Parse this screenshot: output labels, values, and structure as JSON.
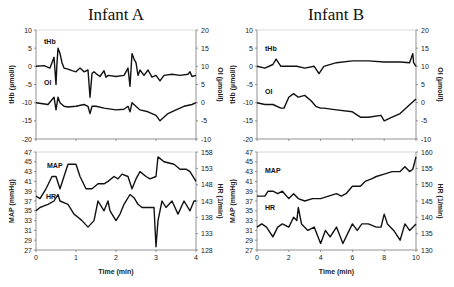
{
  "chart_data": [
    {
      "type": "line",
      "panel": "Infant A - top",
      "title": "Infant A",
      "xlabel": "",
      "ylabel": "tHb (µmol/l)",
      "y2label": "OI (µmol/l)",
      "xlim": [
        0,
        4
      ],
      "ylim": [
        -20,
        10
      ],
      "y2lim": [
        -10,
        20
      ],
      "yticks": [
        10,
        5,
        0,
        -5,
        -10,
        -15,
        -20
      ],
      "y2ticks": [
        20,
        15,
        10,
        5,
        0,
        -5,
        -10
      ],
      "grid": false,
      "series": [
        {
          "name": "tHb",
          "axis": "left",
          "x": [
            0,
            0.2,
            0.35,
            0.45,
            0.5,
            0.52,
            0.55,
            0.6,
            0.65,
            0.7,
            0.8,
            0.9,
            1.0,
            1.1,
            1.2,
            1.3,
            1.35,
            1.4,
            1.45,
            1.5,
            1.6,
            1.7,
            1.75,
            1.8,
            2.0,
            2.2,
            2.3,
            2.35,
            2.4,
            2.45,
            2.5,
            2.55,
            2.6,
            2.7,
            2.8,
            2.9,
            3.0,
            3.1,
            3.2,
            3.4,
            3.6,
            3.8,
            3.85,
            3.9,
            4.0
          ],
          "values": [
            0,
            0.2,
            -0.5,
            2.5,
            -5,
            0,
            5,
            3.5,
            1,
            -0.5,
            -0.8,
            -1.2,
            -1.5,
            -0.5,
            -1.5,
            -1,
            -8.5,
            -2,
            -1.5,
            -2,
            -2.8,
            -1.2,
            -3,
            -2.5,
            -2.8,
            -2.5,
            -0.5,
            -5.5,
            3.5,
            2,
            1,
            -2.5,
            -1,
            -2.5,
            -1,
            -3,
            -2.5,
            -4,
            -2.5,
            -2.2,
            -2.5,
            -2.2,
            -1.5,
            -2.8,
            -2.5
          ]
        },
        {
          "name": "OI",
          "axis": "right",
          "x": [
            0,
            0.3,
            0.45,
            0.5,
            0.55,
            0.6,
            0.7,
            0.8,
            1.0,
            1.2,
            1.3,
            1.35,
            1.4,
            1.5,
            1.7,
            2.0,
            2.2,
            2.3,
            2.35,
            2.4,
            2.6,
            2.8,
            3.0,
            3.1,
            3.3,
            3.5,
            3.7,
            3.9,
            4.0
          ],
          "values": [
            0,
            -0.5,
            1.5,
            -2,
            1.5,
            0,
            -1,
            -1.2,
            -1,
            -0.5,
            -1,
            -3,
            -1,
            -1,
            -1.5,
            -2,
            -1.8,
            -1,
            -2.5,
            0,
            -2,
            -2.5,
            -3.5,
            -5,
            -3,
            -2,
            -1,
            -0.5,
            0
          ]
        }
      ]
    },
    {
      "type": "line",
      "panel": "Infant A - bottom",
      "xlabel": "Time (min)",
      "ylabel": "MAP (mmHg)",
      "y2label": "HR (1/min)",
      "xlim": [
        0,
        4
      ],
      "xticks": [
        0,
        1,
        2,
        3,
        4
      ],
      "ylim": [
        27,
        47
      ],
      "y2lim": [
        128,
        158
      ],
      "yticks": [
        47,
        45,
        43,
        41,
        39,
        37,
        35,
        33,
        31,
        29,
        27
      ],
      "y2ticks": [
        158,
        153,
        148,
        143,
        138,
        133,
        128
      ],
      "grid": false,
      "series": [
        {
          "name": "MAP",
          "axis": "left",
          "x": [
            0,
            0.1,
            0.25,
            0.4,
            0.5,
            0.6,
            0.7,
            0.8,
            1.0,
            1.1,
            1.25,
            1.4,
            1.55,
            1.7,
            1.8,
            1.95,
            2.05,
            2.15,
            2.3,
            2.4,
            2.5,
            2.6,
            2.75,
            2.85,
            3.0,
            3.05,
            3.2,
            3.45,
            3.6,
            3.75,
            3.85,
            4.0
          ],
          "values": [
            38,
            37.5,
            39.5,
            42,
            42,
            39.5,
            42,
            44.5,
            44.5,
            42,
            39.5,
            39.5,
            40.5,
            40.5,
            41,
            42,
            41.5,
            42.5,
            42,
            39.5,
            41.5,
            43,
            42,
            41.5,
            42,
            46,
            45,
            44.5,
            43.5,
            43.5,
            43,
            41
          ]
        },
        {
          "name": "HR",
          "axis": "right",
          "x": [
            0,
            0.1,
            0.2,
            0.3,
            0.45,
            0.55,
            0.6,
            0.8,
            0.95,
            1.05,
            1.15,
            1.3,
            1.45,
            1.55,
            1.7,
            1.8,
            1.85,
            2.0,
            2.1,
            2.2,
            2.35,
            2.45,
            2.55,
            2.65,
            2.8,
            2.95,
            3.0,
            3.05,
            3.15,
            3.25,
            3.4,
            3.55,
            3.7,
            3.85,
            3.95,
            4.0
          ],
          "values": [
            140,
            141,
            141.5,
            142,
            143,
            145,
            143,
            142,
            139,
            138,
            137,
            135,
            137,
            143,
            140,
            143,
            140,
            137,
            139,
            142,
            145,
            144,
            142,
            141,
            141,
            141,
            129,
            137,
            143,
            141,
            143,
            139,
            143,
            140,
            143,
            143
          ]
        }
      ]
    },
    {
      "type": "line",
      "panel": "Infant B - top",
      "title": "Infant B",
      "xlabel": "",
      "ylabel": "tHb (µmol/l)",
      "y2label": "OI (µmol/l)",
      "xlim": [
        0,
        10
      ],
      "ylim": [
        -20,
        10
      ],
      "y2lim": [
        -10,
        20
      ],
      "yticks": [
        10,
        5,
        0,
        -5,
        -10,
        -15,
        -20
      ],
      "y2ticks": [
        20,
        15,
        10,
        5,
        0,
        -5,
        -10
      ],
      "grid": false,
      "series": [
        {
          "name": "tHb",
          "axis": "left",
          "x": [
            0,
            0.5,
            1.0,
            1.2,
            1.5,
            2.0,
            2.5,
            3.0,
            3.6,
            3.9,
            4.2,
            5.0,
            6.0,
            7.0,
            8.0,
            9.0,
            9.6,
            9.8,
            9.85,
            10.0
          ],
          "values": [
            0,
            -0.5,
            0.5,
            2,
            0,
            0,
            0,
            -0.5,
            0,
            -2,
            0,
            1,
            1.5,
            1.5,
            1.2,
            1.2,
            1,
            3.5,
            1,
            0
          ]
        },
        {
          "name": "OI",
          "axis": "right",
          "x": [
            0,
            0.5,
            1.0,
            1.5,
            1.7,
            2.0,
            2.3,
            2.6,
            3.0,
            3.4,
            3.7,
            4.0,
            4.2,
            5.0,
            6.0,
            6.5,
            7.0,
            7.8,
            8.0,
            8.5,
            9.0,
            9.5,
            10.0
          ],
          "values": [
            0,
            -0.5,
            -0.5,
            -1.5,
            -1.5,
            1.5,
            2.5,
            1.5,
            2,
            0.5,
            -1,
            -1.5,
            -1.5,
            -2,
            -2.5,
            -4,
            -4,
            -3.5,
            -5,
            -4,
            -3,
            -1,
            1
          ]
        }
      ]
    },
    {
      "type": "line",
      "panel": "Infant B - bottom",
      "xlabel": "Time (min)",
      "ylabel": "MAP (mmHg)",
      "y2label": "HR (1/min)",
      "xlim": [
        0,
        10
      ],
      "xticks": [
        0,
        2,
        4,
        6,
        8,
        10
      ],
      "ylim": [
        27,
        47
      ],
      "y2lim": [
        130,
        160
      ],
      "yticks": [
        47,
        45,
        43,
        41,
        39,
        37,
        35,
        33,
        31,
        29,
        27
      ],
      "y2ticks": [
        160,
        155,
        150,
        145,
        140,
        135,
        130
      ],
      "grid": false,
      "series": [
        {
          "name": "MAP",
          "axis": "left",
          "x": [
            0,
            0.5,
            0.7,
            1.0,
            1.3,
            1.6,
            2.0,
            2.3,
            2.6,
            3.0,
            3.5,
            4.0,
            4.5,
            5.0,
            5.3,
            5.6,
            6.0,
            6.5,
            6.8,
            7.2,
            7.5,
            8.0,
            8.5,
            9.0,
            9.3,
            9.6,
            9.8,
            10.0
          ],
          "values": [
            38,
            38,
            39,
            39,
            38.5,
            39,
            37.5,
            38.5,
            37.5,
            37,
            37.5,
            37.5,
            38,
            38.5,
            38,
            38.5,
            40,
            40,
            41,
            41.5,
            42,
            42.5,
            43,
            43,
            44,
            43,
            43.5,
            46
          ]
        },
        {
          "name": "HR",
          "axis": "right",
          "x": [
            0,
            0.3,
            0.6,
            1.0,
            1.3,
            1.6,
            2.0,
            2.3,
            2.5,
            2.6,
            2.8,
            3.2,
            3.6,
            4.0,
            4.3,
            4.6,
            5.0,
            5.4,
            5.8,
            6.0,
            6.3,
            6.6,
            7.0,
            7.5,
            7.8,
            8.0,
            8.2,
            8.6,
            9.0,
            9.3,
            9.6,
            10.0
          ],
          "values": [
            137,
            138,
            137,
            134,
            137,
            138,
            137,
            140,
            139,
            143,
            138,
            136,
            137,
            132,
            136,
            134,
            137,
            132,
            136,
            138,
            136,
            138,
            138,
            137,
            137,
            141,
            138,
            136,
            133,
            138,
            136,
            138
          ]
        }
      ]
    }
  ],
  "panels": {
    "left": {
      "title": "Infant A"
    },
    "right": {
      "title": "Infant B"
    }
  },
  "labels": {
    "thb": "tHb",
    "oi": "OI",
    "map": "MAP",
    "hr": "HR",
    "thb_axis": "tHb (µmol/l)",
    "oi_axis": "OI (µmol/l)",
    "map_axis": "MAP (mmHg)",
    "hr_axis": "HR (1/min)",
    "time_axis": "Time (min)"
  }
}
